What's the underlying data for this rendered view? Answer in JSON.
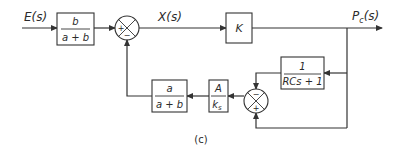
{
  "diagram": {
    "figure_label": "(c)",
    "signals": {
      "input": "E(s)",
      "intermediate": "X(s)",
      "output_main": "P",
      "output_sub": "c",
      "output_suffix": "(s)"
    },
    "blocks": {
      "input_gain": {
        "numerator": "b",
        "denominator": "a + b"
      },
      "forward_gain": {
        "label": "K"
      },
      "lag": {
        "numerator": "1",
        "denominator": "RCs + 1"
      },
      "sensor": {
        "numerator": "A",
        "denominator_main": "k",
        "denominator_sub": "s"
      },
      "feedback_gain": {
        "numerator": "a",
        "denominator": "a + b"
      }
    },
    "junctions": {
      "sum1": {
        "left_sign": "+",
        "bottom_sign": "−"
      },
      "sum2": {
        "top_sign": "−",
        "bottom_sign": "+"
      }
    },
    "colors": {
      "line": "#333333",
      "text": "#2a2a2a",
      "background": "#ffffff"
    }
  }
}
